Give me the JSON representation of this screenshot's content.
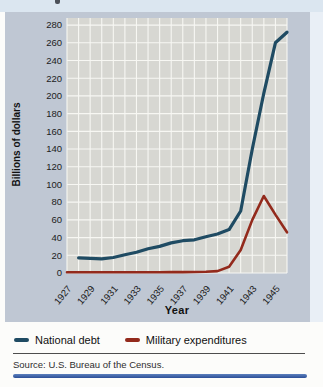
{
  "colors": {
    "band_bg": "#bfc7d3",
    "plot_bg": "#d7d7d2",
    "grid": "#f7f7f3",
    "national_debt": "#1f4b63",
    "military_expenditures": "#932a1c",
    "bottom_rule": "#2c4f97"
  },
  "chart_data": {
    "type": "line",
    "title": "",
    "xlabel": "Year",
    "ylabel": "Billions of dollars",
    "xlim": [
      1927,
      1946
    ],
    "ylim": [
      0,
      288
    ],
    "grid": true,
    "legend_position": "bottom",
    "y_ticks": [
      0,
      20,
      40,
      60,
      80,
      100,
      120,
      140,
      160,
      180,
      200,
      220,
      240,
      260,
      280
    ],
    "x_tick_labels": [
      "1927",
      "1929",
      "1931",
      "1933",
      "1935",
      "1937",
      "1939",
      "1941",
      "1943",
      "1945"
    ],
    "series": [
      {
        "name": "National debt",
        "color": "#1f4b63",
        "x": [
          1928,
          1929,
          1930,
          1931,
          1932,
          1933,
          1934,
          1935,
          1936,
          1937,
          1938,
          1939,
          1940,
          1941,
          1942,
          1943,
          1944,
          1945,
          1946
        ],
        "values": [
          17,
          16.5,
          16,
          17.5,
          20.5,
          23.5,
          27.5,
          30,
          34,
          36.5,
          37.5,
          41,
          44,
          49,
          70,
          140,
          203,
          260,
          272
        ]
      },
      {
        "name": "Military expenditures",
        "color": "#932a1c",
        "x": [
          1927,
          1928,
          1929,
          1930,
          1931,
          1932,
          1933,
          1934,
          1935,
          1936,
          1937,
          1938,
          1939,
          1940,
          1941,
          1942,
          1943,
          1944,
          1945,
          1946
        ],
        "values": [
          0.8,
          0.8,
          0.8,
          0.8,
          0.8,
          0.8,
          0.8,
          0.8,
          0.9,
          1,
          1,
          1.1,
          1.3,
          2.2,
          7,
          26,
          60,
          87,
          66,
          46
        ]
      }
    ]
  },
  "legend": {
    "items": [
      {
        "label": "National debt",
        "color": "#1f4b63"
      },
      {
        "label": "Military expenditures",
        "color": "#932a1c"
      }
    ]
  },
  "source": {
    "text": "Source: U.S. Bureau of the Census."
  }
}
